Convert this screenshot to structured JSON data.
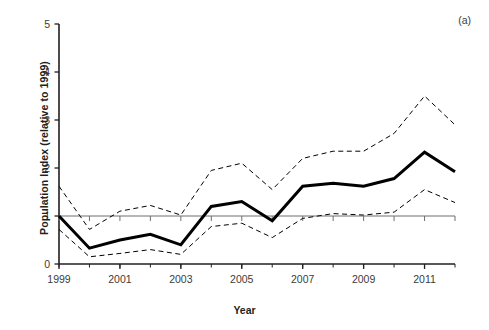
{
  "figure": {
    "panel_label": "(a)",
    "xlabel": "Year",
    "ylabel": "Population Index (relative to 1999)"
  },
  "axes": {
    "y_ticks": [
      "0",
      "1",
      "2",
      "3",
      "4",
      "5"
    ],
    "x_ticks": [
      "1999",
      "2001",
      "2003",
      "2005",
      "2007",
      "2009",
      "2011"
    ]
  },
  "colors": {
    "line": "#000000",
    "axis": "#231f20",
    "text": "#3b3b3b",
    "background": "#ffffff"
  },
  "chart_data": {
    "type": "line",
    "title": "",
    "subtitle": "",
    "xlabel": "Year",
    "ylabel": "Population Index (relative to 1999)",
    "annotations": [
      "(a)"
    ],
    "xlim": [
      1999,
      2012
    ],
    "ylim": [
      0,
      5
    ],
    "yticks": [
      0,
      1,
      2,
      3,
      4,
      5
    ],
    "xticks": [
      1999,
      2001,
      2003,
      2005,
      2007,
      2009,
      2011
    ],
    "xtick_minor_step": 1,
    "grid": false,
    "legend": "none",
    "reference_line": {
      "y": 1,
      "style": "solid",
      "width": 1
    },
    "x": [
      1999,
      2000,
      2001,
      2002,
      2003,
      2004,
      2005,
      2006,
      2007,
      2008,
      2009,
      2010,
      2011,
      2012
    ],
    "series": [
      {
        "name": "Upper confidence limit",
        "style": "dashed",
        "width": 1,
        "values": [
          1.62,
          0.72,
          1.1,
          1.22,
          1.02,
          1.95,
          2.1,
          1.55,
          2.2,
          2.35,
          2.35,
          2.72,
          3.5,
          2.9
        ]
      },
      {
        "name": "Population index",
        "style": "solid",
        "width": 3,
        "values": [
          1.0,
          0.33,
          0.5,
          0.62,
          0.4,
          1.2,
          1.3,
          0.9,
          1.62,
          1.68,
          1.62,
          1.78,
          2.33,
          1.92
        ]
      },
      {
        "name": "Lower confidence limit",
        "style": "dashed",
        "width": 1,
        "values": [
          0.72,
          0.15,
          0.22,
          0.3,
          0.2,
          0.78,
          0.85,
          0.55,
          0.95,
          1.05,
          1.02,
          1.08,
          1.55,
          1.28
        ]
      }
    ]
  }
}
